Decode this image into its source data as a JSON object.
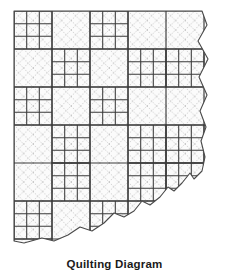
{
  "figure": {
    "title": "Quilting Diagram",
    "type": "quilt-layout-diagram",
    "colors": {
      "background": "#ffffff",
      "block_fill": "#fbfbfb",
      "seam_line": "#3a3a3a",
      "quilting_line": "#b6b6b6",
      "torn_edge": "#4a4a4a",
      "caption_text": "#1a1a1a"
    },
    "geometry": {
      "view_width": 229,
      "view_height": 252,
      "quilt_left": 14,
      "quilt_top": 11,
      "block_size": 38,
      "columns": 5,
      "rows": 6,
      "nine_patch_divisions": 3
    },
    "quilting": {
      "pattern": "diagonal crosshatch",
      "spacing": 9.5,
      "directions": [
        "45deg",
        "-45deg"
      ],
      "line_style": "dotted"
    },
    "blocks": [
      {
        "row": 0,
        "col": 0,
        "kind": "nine-patch"
      },
      {
        "row": 0,
        "col": 1,
        "kind": "plain"
      },
      {
        "row": 0,
        "col": 2,
        "kind": "nine-patch"
      },
      {
        "row": 0,
        "col": 3,
        "kind": "plain"
      },
      {
        "row": 0,
        "col": 4,
        "kind": "plain"
      },
      {
        "row": 1,
        "col": 0,
        "kind": "plain"
      },
      {
        "row": 1,
        "col": 1,
        "kind": "nine-patch"
      },
      {
        "row": 1,
        "col": 2,
        "kind": "plain"
      },
      {
        "row": 1,
        "col": 3,
        "kind": "nine-patch"
      },
      {
        "row": 1,
        "col": 4,
        "kind": "nine-patch"
      },
      {
        "row": 2,
        "col": 0,
        "kind": "nine-patch"
      },
      {
        "row": 2,
        "col": 1,
        "kind": "plain"
      },
      {
        "row": 2,
        "col": 2,
        "kind": "nine-patch"
      },
      {
        "row": 2,
        "col": 3,
        "kind": "plain"
      },
      {
        "row": 2,
        "col": 4,
        "kind": "plain"
      },
      {
        "row": 3,
        "col": 0,
        "kind": "plain"
      },
      {
        "row": 3,
        "col": 1,
        "kind": "nine-patch"
      },
      {
        "row": 3,
        "col": 2,
        "kind": "plain"
      },
      {
        "row": 3,
        "col": 3,
        "kind": "nine-patch"
      },
      {
        "row": 3,
        "col": 4,
        "kind": "nine-patch"
      },
      {
        "row": 4,
        "col": 0,
        "kind": "plain"
      },
      {
        "row": 4,
        "col": 1,
        "kind": "nine-patch"
      },
      {
        "row": 4,
        "col": 2,
        "kind": "plain"
      },
      {
        "row": 4,
        "col": 3,
        "kind": "nine-patch"
      },
      {
        "row": 4,
        "col": 4,
        "kind": "nine-patch"
      },
      {
        "row": 5,
        "col": 0,
        "kind": "nine-patch"
      },
      {
        "row": 5,
        "col": 1,
        "kind": "plain"
      },
      {
        "row": 5,
        "col": 2,
        "kind": "nine-patch"
      },
      {
        "row": 5,
        "col": 3,
        "kind": "plain"
      },
      {
        "row": 5,
        "col": 4,
        "kind": "plain"
      }
    ],
    "edges": {
      "right": "torn-wavy",
      "bottom": "torn-diagonal",
      "left": "straight",
      "top": "straight"
    }
  }
}
